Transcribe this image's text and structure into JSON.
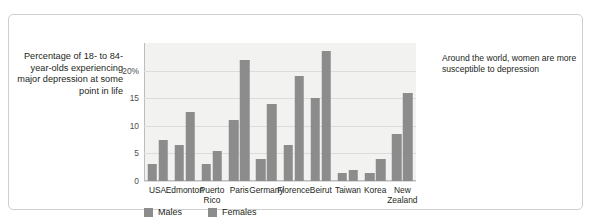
{
  "caption": "Percentage of 18- to 84-year-olds experiencing major depression at some point in life",
  "annotation": "Around the world, women are more susceptible to depression",
  "legend": {
    "males_label": "Males",
    "females_label": "Females"
  },
  "colors": {
    "males": "#8c8c8c",
    "females": "#8c8c8c",
    "plot_background": "#f2f2f0",
    "gridline": "#dcdcda",
    "axis": "#bdbdbd",
    "text": "#231f20",
    "frame": "#cfcfcf"
  },
  "chart_data": {
    "type": "bar",
    "title": "",
    "subtitle": "",
    "xlabel": "",
    "ylabel": "Percentage of 18- to 84-year-olds experiencing major depression at some point in life",
    "ylim": [
      0,
      25
    ],
    "yticks": [
      0,
      5,
      10,
      15,
      20
    ],
    "ytick_labels": [
      "0",
      "5",
      "10",
      "15",
      "20%"
    ],
    "grid": true,
    "legend_position": "bottom-left",
    "annotations": [
      "Around the world, women are more susceptible to depression"
    ],
    "categories": [
      "USA",
      "Edmonton",
      "Puerto\nRico",
      "Paris",
      "Germany",
      "Florence",
      "Beirut",
      "Taiwan",
      "Korea",
      "New\nZealand"
    ],
    "series": [
      {
        "name": "Males",
        "values": [
          3.0,
          6.5,
          3.0,
          11.0,
          4.0,
          6.5,
          15.0,
          1.5,
          1.5,
          8.5
        ]
      },
      {
        "name": "Females",
        "values": [
          7.5,
          12.5,
          5.5,
          22.0,
          14.0,
          19.0,
          23.5,
          2.0,
          4.0,
          16.0
        ]
      }
    ]
  }
}
